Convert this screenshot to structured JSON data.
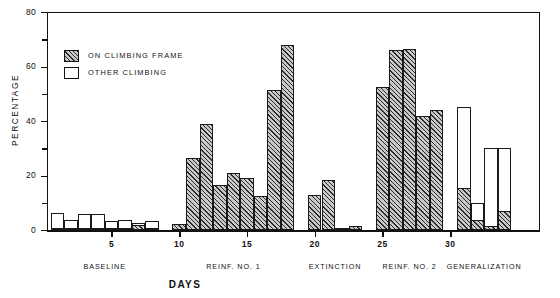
{
  "chart_data": {
    "type": "bar",
    "title": "",
    "xlabel": "DAYS",
    "ylabel": "PERCENTAGE",
    "ylim": [
      0,
      80
    ],
    "yticks": [
      0,
      20,
      40,
      60,
      80
    ],
    "yminorticks": [
      10,
      30,
      50,
      70
    ],
    "xticks": [
      5,
      10,
      15,
      20,
      25,
      30
    ],
    "grid": false,
    "stacked": true,
    "legend_position": "upper-left",
    "series": [
      {
        "name": "ON CLIMBING FRAME",
        "fill": "hatched",
        "color": "#2b2b2b"
      },
      {
        "name": "OTHER CLIMBING",
        "fill": "open",
        "color": "#ffffff"
      }
    ],
    "phases": [
      {
        "label": "BASELINE",
        "days": [
          1,
          2,
          3,
          4,
          5,
          6,
          7,
          8
        ],
        "on_climbing_frame": [
          0.8,
          0.6,
          0.8,
          0.8,
          0.6,
          0.6,
          1.8,
          0.8
        ],
        "other_climbing": [
          5.4,
          2.9,
          5.0,
          5.2,
          2.7,
          3.2,
          0.9,
          2.4
        ]
      },
      {
        "label": "REINF. NO. 1",
        "days": [
          10,
          11,
          12,
          13,
          14,
          15,
          16,
          17
        ],
        "on_climbing_frame": [
          2.2,
          26.5,
          39.0,
          16.5,
          21.0,
          19.0,
          12.5,
          51.5
        ],
        "other_climbing": [
          0,
          0,
          0,
          0,
          0,
          0,
          0,
          0
        ]
      },
      {
        "label": "REINF. NO. 1 (cont)",
        "days": [
          18
        ],
        "on_climbing_frame": [
          68.0
        ],
        "other_climbing": [
          0
        ]
      },
      {
        "label": "EXTINCTION",
        "days": [
          20,
          21,
          22,
          23
        ],
        "on_climbing_frame": [
          13.0,
          18.5,
          0.4,
          1.4
        ],
        "other_climbing": [
          0,
          0,
          0,
          0
        ]
      },
      {
        "label": "REINF. NO. 2",
        "days": [
          25,
          26,
          27,
          28,
          29
        ],
        "on_climbing_frame": [
          52.5,
          66.0,
          66.5,
          42.0,
          44.0
        ],
        "other_climbing": [
          0,
          0,
          0,
          0,
          0
        ]
      },
      {
        "label": "GENERALIZATION",
        "days": [
          31,
          32,
          33,
          34
        ],
        "on_climbing_frame": [
          15.5,
          3.5,
          1.5,
          7.0
        ],
        "other_climbing": [
          29.5,
          6.5,
          28.5,
          23.0
        ]
      }
    ]
  },
  "legend": {
    "items": [
      {
        "label": "ON CLIMBING FRAME"
      },
      {
        "label": "OTHER CLIMBING"
      }
    ]
  },
  "axis": {
    "y_title": "PERCENTAGE",
    "x_title": "DAYS",
    "y_labels": [
      "80",
      "60",
      "40",
      "20",
      "0"
    ],
    "x_labels": [
      "5",
      "10",
      "15",
      "20",
      "25",
      "30"
    ]
  },
  "phase_labels": [
    "BASELINE",
    "REINF. NO. 1",
    "EXTINCTION",
    "REINF. NO. 2",
    "GENERALIZATION"
  ]
}
